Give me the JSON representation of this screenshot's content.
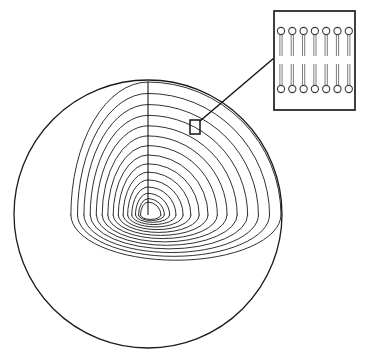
{
  "figure": {
    "name": "multilamellar-vesicle-cutaway",
    "background_color": "#ffffff",
    "line_color": "#1a1a1a",
    "width": 367,
    "height": 364
  },
  "sphere": {
    "name": "vesicle-sphere",
    "center_x": 148,
    "center_y": 214,
    "radius": 134,
    "outline_color": "#1a1a1a",
    "outline_width": 1.3
  },
  "cutaway": {
    "name": "octant-cutaway",
    "apex_x": 148,
    "apex_y": 215,
    "layer_count": 15,
    "outer_radius": 133,
    "inner_radius": 13,
    "layer_color": "#1a1a1a",
    "layer_width": 0.9,
    "vertical_axis_top_y": 82,
    "left_corner_x": 88,
    "left_corner_y": 262,
    "right_corner_x": 256,
    "right_corner_y": 240,
    "floor_squash": 0.34,
    "left_wall_squash": 0.58
  },
  "callout": {
    "name": "bilayer-callout",
    "square_x": 190,
    "square_y": 120,
    "square_width": 10,
    "square_height": 14,
    "line_start_x": 200,
    "line_start_y": 121,
    "line_end_x": 274,
    "line_end_y": 58,
    "stroke_color": "#111111"
  },
  "inset": {
    "name": "bilayer-inset",
    "x": 274,
    "y": 11,
    "width": 81,
    "height": 99,
    "border_color": "#2b2b2b",
    "border_width": 1.8,
    "fill_color": "#ffffff",
    "bilayer": {
      "name": "lipid-bilayer",
      "lipid_count_per_leaflet": 7,
      "head_radius": 3.6,
      "head_fill": "#ffffff",
      "head_stroke": "#3a3a3a",
      "tail_color": "#6e6e6e",
      "tail_pair_gap": 2.2,
      "upper_leaflet_head_y": 31,
      "upper_leaflet_tail_end_y": 56,
      "lower_leaflet_head_y": 89,
      "lower_leaflet_tail_end_y": 64,
      "first_lipid_x": 281,
      "lipid_spacing": 11.3
    }
  },
  "accessibility": {
    "alt_text": "Diagram of a multilamellar vesicle shown as a sphere with one octant cut away to reveal concentric lipid lamellae, with a magnified inset of a lipid bilayer showing two leaflets of phospholipids with circular head groups and paired tails."
  }
}
